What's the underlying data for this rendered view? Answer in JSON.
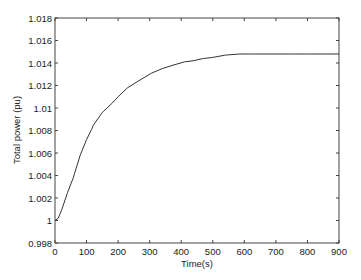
{
  "chart_data": {
    "type": "line",
    "title": "",
    "xlabel": "Time(s)",
    "ylabel": "Total power (pu)",
    "xlim": [
      0,
      900
    ],
    "ylim": [
      0.998,
      1.018
    ],
    "grid": false,
    "legend": null,
    "x_ticks": [
      0,
      100,
      200,
      300,
      400,
      500,
      600,
      700,
      800,
      900
    ],
    "x_tick_labels": [
      "0",
      "100",
      "200",
      "300",
      "400",
      "500",
      "600",
      "700",
      "800",
      "900"
    ],
    "y_ticks": [
      0.998,
      1.0,
      1.002,
      1.004,
      1.006,
      1.008,
      1.01,
      1.012,
      1.014,
      1.016,
      1.018
    ],
    "y_tick_labels": [
      "0.998",
      "1",
      "1.002",
      "1.004",
      "1.006",
      "1.008",
      "1.01",
      "1.012",
      "1.014",
      "1.016",
      "1.018"
    ],
    "series": [
      {
        "name": "Total power",
        "color": "#333333",
        "x": [
          0,
          10,
          22,
          40,
          58,
          62,
          80,
          100,
          116,
          122,
          150,
          180,
          200,
          230,
          270,
          306,
          340,
          374,
          410,
          437,
          470,
          500,
          540,
          586,
          620,
          650,
          700,
          750,
          800,
          850,
          900
        ],
        "y": [
          1.0,
          1.0002,
          1.001,
          1.0025,
          1.0038,
          1.0042,
          1.0058,
          1.0072,
          1.0081,
          1.0085,
          1.0096,
          1.0104,
          1.011,
          1.0118,
          1.0125,
          1.0131,
          1.0135,
          1.0138,
          1.0141,
          1.0142,
          1.0144,
          1.0145,
          1.0147,
          1.0148,
          1.0148,
          1.0148,
          1.0148,
          1.0148,
          1.0148,
          1.0148,
          1.0148
        ]
      }
    ]
  },
  "colors": {
    "axis": "#444444",
    "line": "#333333",
    "background": "#ffffff"
  }
}
